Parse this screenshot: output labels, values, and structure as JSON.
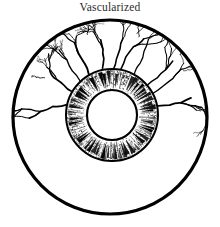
{
  "figure": {
    "title": "Vascularized",
    "type": "anatomical-line-drawing",
    "condition": "corneal neovascularization",
    "style": "black-and-white line art",
    "canvas": {
      "width": 220,
      "height": 227
    }
  },
  "colors": {
    "ink": "#000000",
    "title_text": "#2b2b2b",
    "background": "#ffffff",
    "sclera_fill": "#ffffff",
    "pupil_fill": "#ffffff",
    "iris_stipple": "#1a1a1a"
  },
  "geometry": {
    "globe": {
      "cx": 110,
      "cy": 117,
      "r": 97,
      "stroke_width": 3.2
    },
    "iris": {
      "cx": 112,
      "cy": 115,
      "r_outer": 46,
      "r_inner": 25,
      "stroke_width": 2.0
    },
    "pupil": {
      "cx": 112,
      "cy": 115,
      "r": 25
    },
    "iris_spokes": 64,
    "vessel_arc_degrees": [
      185,
      355
    ],
    "vessel_trunk_count": 11
  },
  "parts": [
    {
      "name": "sclera",
      "label": "Sclera"
    },
    {
      "name": "limbus",
      "label": "Limbus"
    },
    {
      "name": "iris",
      "label": "Iris"
    },
    {
      "name": "pupil",
      "label": "Pupil"
    },
    {
      "name": "vessels",
      "label": "Blood vessels"
    }
  ],
  "chart_data": {
    "type": "diagram",
    "title": "Vascularized",
    "elements": [
      {
        "id": "globe",
        "shape": "circle",
        "cx": 110,
        "cy": 117,
        "r": 97
      },
      {
        "id": "iris-ring",
        "shape": "annulus",
        "cx": 112,
        "cy": 115,
        "r_outer": 46,
        "r_inner": 25
      },
      {
        "id": "pupil",
        "shape": "circle",
        "cx": 112,
        "cy": 115,
        "r": 25
      },
      {
        "id": "vessel-field",
        "shape": "radial-branching",
        "coverage": "upper hemisphere"
      }
    ]
  }
}
